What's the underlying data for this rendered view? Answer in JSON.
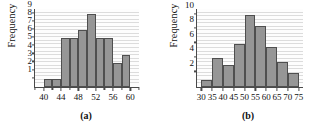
{
  "figure": {
    "panels": [
      {
        "caption": "(a)",
        "ylabel": "Frequency",
        "chart_data": {
          "type": "bar",
          "title": "",
          "xlabel": "",
          "ylabel": "Frequency",
          "grid": true,
          "legend": "none",
          "xlim": [
            38,
            62
          ],
          "ylim": [
            0,
            9.6
          ],
          "bin_width": 2,
          "bin_starts": [
            40,
            42,
            44,
            46,
            48,
            50,
            52,
            54,
            56,
            58
          ],
          "categories": [
            "40-42",
            "42-44",
            "44-46",
            "46-48",
            "48-50",
            "50-52",
            "52-54",
            "54-56",
            "56-58",
            "58-60"
          ],
          "values": [
            1,
            1,
            6,
            6,
            7,
            9,
            6,
            6,
            3,
            4
          ],
          "x_major_ticks": [
            40,
            44,
            48,
            52,
            56,
            60
          ],
          "x_minor_ticks": [
            38,
            42,
            46,
            50,
            54,
            58,
            62
          ],
          "x_tick_labels": [
            "40",
            "44",
            "48",
            "52",
            "56",
            "60"
          ],
          "y_ticks": [
            1,
            2,
            3,
            4,
            5,
            6,
            7,
            8,
            9
          ],
          "y_tick_labels": [
            "1",
            "2",
            "3",
            "4",
            "5",
            "6",
            "7",
            "8",
            "9"
          ]
        }
      },
      {
        "caption": "(b)",
        "ylabel": "Frequency",
        "chart_data": {
          "type": "bar",
          "title": "",
          "xlabel": "",
          "ylabel": "Frequency",
          "grid": true,
          "legend": "none",
          "xlim": [
            28,
            77
          ],
          "ylim": [
            0,
            10.8
          ],
          "bin_width": 5,
          "bin_starts": [
            30,
            35,
            40,
            45,
            50,
            55,
            60,
            65,
            70
          ],
          "categories": [
            "30-35",
            "35-40",
            "40-45",
            "45-50",
            "50-55",
            "55-60",
            "60-65",
            "65-70",
            "70-75"
          ],
          "values": [
            1,
            4,
            3,
            6,
            10,
            8.5,
            5.5,
            3.5,
            2
          ],
          "x_major_ticks": [
            30,
            35,
            40,
            45,
            50,
            55,
            60,
            65,
            70,
            75
          ],
          "x_minor_ticks": [],
          "x_tick_labels": [
            "30",
            "35",
            "40",
            "45",
            "50",
            "55",
            "60",
            "65",
            "70",
            "75"
          ],
          "y_ticks": [
            2,
            4,
            6,
            8,
            10
          ],
          "y_tick_labels": [
            "2",
            "4",
            "6",
            "8",
            "10"
          ]
        }
      }
    ],
    "colors": {
      "bar_fill": "#969696",
      "bar_stroke": "#4f4f4f",
      "axis": "#4a4a4a",
      "gridline": "#dcdcdc",
      "text": "#111111",
      "background": "#ffffff"
    }
  }
}
